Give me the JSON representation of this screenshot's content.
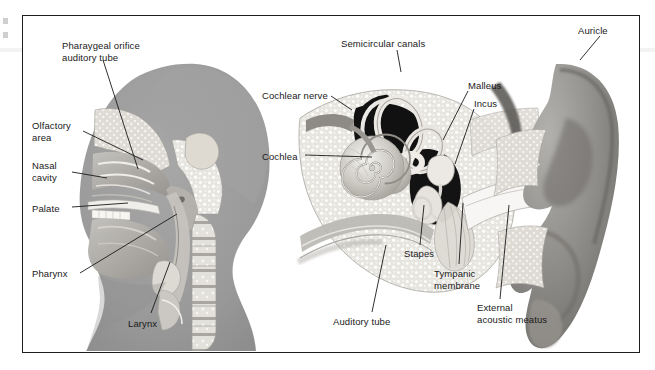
{
  "figure": {
    "frame_color": "#1d1d1d",
    "background": "#ffffff"
  },
  "palette": {
    "head_silhouette": "#9a9a9a",
    "bone_light": "#e9e8e4",
    "tissue_mid": "#b6b4b1",
    "tissue_dark": "#8d8b88",
    "cavity_dark": "#1b1b1b",
    "label_text": "#1a1a1a",
    "leader_line": "#1a1a1a"
  },
  "panels": [
    {
      "name": "sagittal-head-panel",
      "labels": [
        {
          "id": "pharyngeal-orifice",
          "text": "Pharaygeal orifice\nauditory tube",
          "x": 62,
          "y": 40,
          "align": "left"
        },
        {
          "id": "olfactory-area",
          "text": "Olfactory\narea",
          "x": 32,
          "y": 120,
          "align": "left"
        },
        {
          "id": "nasal-cavity",
          "text": "Nasal\ncavity",
          "x": 32,
          "y": 160,
          "align": "left"
        },
        {
          "id": "palate",
          "text": "Palate",
          "x": 32,
          "y": 203,
          "align": "left"
        },
        {
          "id": "pharynx",
          "text": "Pharynx",
          "x": 32,
          "y": 268,
          "align": "left"
        },
        {
          "id": "larynx",
          "text": "Larynx",
          "x": 128,
          "y": 318,
          "align": "left"
        }
      ]
    },
    {
      "name": "ear-panel",
      "labels": [
        {
          "id": "semicircular-canals",
          "text": "Semicircular canals",
          "x": 341,
          "y": 38,
          "align": "left"
        },
        {
          "id": "auricle",
          "text": "Auricle",
          "x": 578,
          "y": 25,
          "align": "left"
        },
        {
          "id": "cochlear-nerve",
          "text": "Cochlear nerve",
          "x": 262,
          "y": 90,
          "align": "left"
        },
        {
          "id": "malleus",
          "text": "Malleus",
          "x": 468,
          "y": 80,
          "align": "left"
        },
        {
          "id": "incus",
          "text": "Incus",
          "x": 474,
          "y": 98,
          "align": "left"
        },
        {
          "id": "cochlea",
          "text": "Cochlea",
          "x": 262,
          "y": 151,
          "align": "left"
        },
        {
          "id": "stapes",
          "text": "Stapes",
          "x": 404,
          "y": 248,
          "align": "left"
        },
        {
          "id": "tympanic-membrane",
          "text": "Tympanic\nmembrane",
          "x": 434,
          "y": 268,
          "align": "left"
        },
        {
          "id": "auditory-tube",
          "text": "Auditory tube",
          "x": 333,
          "y": 316,
          "align": "left"
        },
        {
          "id": "external-acoustic-meatus",
          "text": "External\nacoustic meatus",
          "x": 477,
          "y": 302,
          "align": "left"
        }
      ]
    }
  ],
  "leader_lines": [
    {
      "id": "lead-pharyngeal-orifice",
      "points": "103,60 138,169"
    },
    {
      "id": "lead-olfactory-area",
      "points": "83,131 143,160"
    },
    {
      "id": "lead-nasal-cavity",
      "points": "72,172 107,178"
    },
    {
      "id": "lead-palate",
      "points": "72,207 128,203"
    },
    {
      "id": "lead-pharynx",
      "points": "80,273 177,214"
    },
    {
      "id": "lead-larynx",
      "points": "151,313 170,262"
    },
    {
      "id": "lead-semicircular-canals",
      "points": "397,50 401,72"
    },
    {
      "id": "lead-auricle",
      "points": "600,36 580,60"
    },
    {
      "id": "lead-cochlear-nerve",
      "points": "331,96 352,110"
    },
    {
      "id": "lead-cochlea",
      "points": "305,155 372,157"
    },
    {
      "id": "lead-malleus",
      "points": "468,91 443,140"
    },
    {
      "id": "lead-incus",
      "points": "474,109 455,164"
    },
    {
      "id": "lead-stapes",
      "points": "420,245 424,205"
    },
    {
      "id": "lead-tympanic-membrane",
      "points": "459,264 463,203"
    },
    {
      "id": "lead-auditory-tube",
      "points": "372,312 386,245"
    },
    {
      "id": "lead-external-acoustic",
      "points": "500,299 509,205"
    }
  ]
}
